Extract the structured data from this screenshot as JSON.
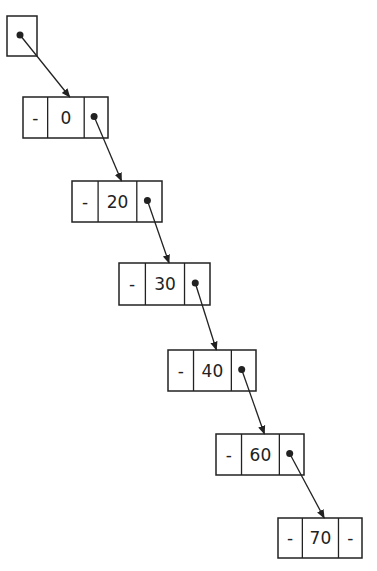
{
  "diagram": {
    "type": "singly-linked-list",
    "head": {
      "label": "head pointer",
      "x": 7,
      "y": 16,
      "w": 30,
      "h": 40
    },
    "nodes": [
      {
        "prev": "-",
        "value": "0",
        "next": "•",
        "x": 23,
        "y": 97,
        "w": 85,
        "h": 41
      },
      {
        "prev": "-",
        "value": "20",
        "next": "•",
        "x": 72,
        "y": 181,
        "w": 90,
        "h": 41
      },
      {
        "prev": "-",
        "value": "30",
        "next": "•",
        "x": 119,
        "y": 263,
        "w": 91,
        "h": 42
      },
      {
        "prev": "-",
        "value": "40",
        "next": "•",
        "x": 168,
        "y": 350,
        "w": 88,
        "h": 41
      },
      {
        "prev": "-",
        "value": "60",
        "next": "•",
        "x": 216,
        "y": 434,
        "w": 88,
        "h": 41
      },
      {
        "prev": "-",
        "value": "70",
        "next": "-",
        "x": 278,
        "y": 518,
        "w": 84,
        "h": 40
      }
    ],
    "colors": {
      "stroke": "#222222",
      "background": "#ffffff"
    }
  }
}
